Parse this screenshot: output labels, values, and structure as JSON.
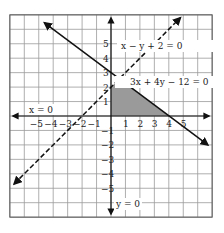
{
  "chart_data": {
    "type": "line",
    "title": "",
    "xlabel": "",
    "ylabel": "",
    "xlim": [
      -7,
      7
    ],
    "ylim": [
      -7,
      7
    ],
    "grid": true,
    "x_ticks": [
      -5,
      -4,
      -3,
      -2,
      -1,
      1,
      2,
      3,
      4,
      5
    ],
    "y_ticks": [
      -5,
      -4,
      -3,
      -2,
      -1,
      1,
      2,
      3,
      4,
      5
    ],
    "x_tick_labels": [
      "−5",
      "−4",
      "−3",
      "−2",
      "−1",
      "1",
      "2",
      "3",
      "4",
      "5"
    ],
    "y_tick_labels": [
      "−5",
      "−4",
      "−3",
      "−2",
      "−1",
      "1",
      "2",
      "3",
      "4",
      "5"
    ],
    "series": [
      {
        "name": "x − y + 2 = 0",
        "style": "dashed",
        "points": [
          [
            -6.7,
            -4.7
          ],
          [
            4.8,
            6.8
          ]
        ]
      },
      {
        "name": "3x + 4y − 12 = 0",
        "style": "solid",
        "points": [
          [
            -4.6,
            6.45
          ],
          [
            6.7,
            -2.0
          ]
        ]
      },
      {
        "name": "x = 0",
        "style": "solid-axis"
      },
      {
        "name": "y = 0",
        "style": "solid-axis"
      }
    ],
    "shaded_region": {
      "description": "Feasible region bounded by x = 0, y = 0, 3x + 4y − 12 = 0 and x − y + 2 = 0",
      "vertices": [
        [
          0,
          0
        ],
        [
          4,
          0
        ],
        [
          0.571,
          2.571
        ],
        [
          0,
          2
        ]
      ],
      "color": "#9a9a9a"
    },
    "annotations": [
      {
        "text": "x − y + 2 = 0",
        "at": [
          1.0,
          5.2
        ]
      },
      {
        "text": "3x + 4y − 12 = 0",
        "at": [
          1.0,
          3.0
        ]
      },
      {
        "text": "x = 0",
        "at": [
          -5.6,
          0.6
        ]
      },
      {
        "text": "y = 0",
        "at": [
          0.2,
          -5.8
        ]
      }
    ]
  },
  "labels": {
    "eq1": "x − y + 2 = 0",
    "eq2": "3x + 4y − 12 = 0",
    "eq3": "x = 0",
    "eq4": "y = 0"
  }
}
